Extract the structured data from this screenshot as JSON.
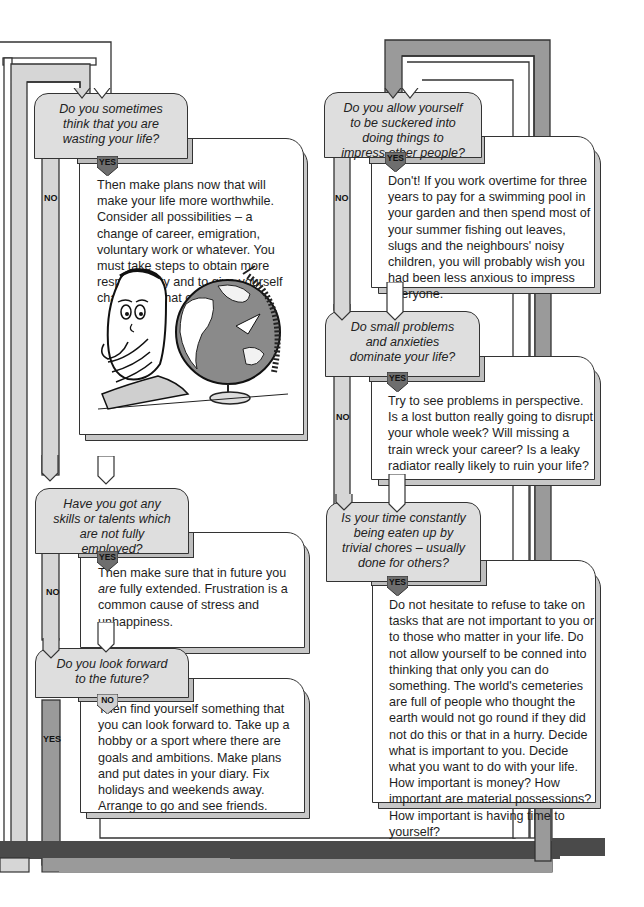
{
  "diagram": {
    "type": "flowchart",
    "colors": {
      "question_fill": "#dedede",
      "card_fill": "#ffffff",
      "outline": "#333333",
      "path_light": "#d6d6d6",
      "path_mid": "#9a9a9a",
      "path_dark": "#4a4a4a",
      "yes_tag": "#6e6e6e",
      "no_tag": "#cfcfcf"
    },
    "left_column": [
      {
        "question": "Do you sometimes think that you are wasting your life?",
        "branch_label": "YES",
        "other_label": "NO",
        "answer": "Then make plans now that will make your life more worthwhile. Consider all possibilities – a change of career, emigration, voluntary work or whatever. You must take steps to obtain more responsibility and to give yourself challenges that can be met.",
        "illustration": "cartoon-man-with-globe"
      },
      {
        "question": "Have you got any skills or talents which are not fully employed?",
        "branch_label": "YES",
        "other_label": "NO",
        "answer_pre": "Then make sure that in future you ",
        "answer_em": "are",
        "answer_post": " fully extended. Frustration is a common cause of stress and unhappiness."
      },
      {
        "question": "Do you look forward to the future?",
        "branch_label": "NO",
        "other_label": "YES",
        "answer": "Then find yourself something that you can look forward to. Take up a hobby or a sport where there are goals and ambitions. Make plans and put dates in your diary. Fix holidays and weekends away. Arrange to go and see friends."
      }
    ],
    "right_column": [
      {
        "question": "Do you allow yourself to be suckered into doing things to impress other people?",
        "branch_label": "YES",
        "other_label": "NO",
        "answer": "Don't! If you work overtime for three years to pay for a swimming pool in your garden and then spend most of your summer fishing out leaves, slugs and the neighbours' noisy children, you will probably wish you had been less anxious to impress everyone."
      },
      {
        "question": "Do small problems and anxieties dominate your life?",
        "branch_label": "YES",
        "other_label": "NO",
        "answer": "Try to see problems in perspective. Is a lost button really going to disrupt your whole week? Will missing a train wreck your career? Is a leaky radiator really likely to ruin your life?"
      },
      {
        "question": "Is your time constantly being eaten up by trivial chores – usually done for others?",
        "branch_label": "YES",
        "answer": "Do not hesitate to refuse to take on tasks that are not important to you or to those who matter in your life. Do not allow yourself to be conned into thinking that only you can do something. The world's cemeteries are full of people who thought the earth would not go round if they did not do this or that in a hurry. Decide what is important to you. Decide what you want to do with your life. How important is money? How important are material possessions? How important is having time to yourself?"
      }
    ]
  }
}
